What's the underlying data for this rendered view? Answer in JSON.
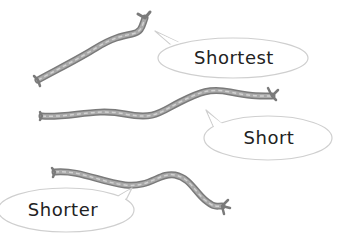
{
  "illustration": {
    "ropes": [
      {
        "id": "rope-1",
        "label": "Shortest"
      },
      {
        "id": "rope-2",
        "label": "Short"
      },
      {
        "id": "rope-3",
        "label": "Shorter"
      }
    ],
    "bubbles": {
      "shortest": "Shortest",
      "short": "Short",
      "shorter": "Shorter"
    },
    "colors": {
      "rope_outer": "#7a7a7a",
      "rope_inner": "#a9a9a9",
      "rope_strand": "#d2d2d2",
      "bubble_fill": "#ffffff",
      "bubble_stroke": "#cfcfcf",
      "text": "#222222"
    }
  }
}
